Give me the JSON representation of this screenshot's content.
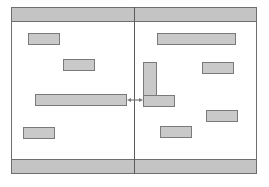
{
  "diagram": {
    "type": "wireframe-layout",
    "colors": {
      "frame_border": "#6e6e6e",
      "bar_fill": "#c4c4c4",
      "box_fill": "#c9c9c9",
      "box_border": "#7a7a7a",
      "divider": "#5a5a5a",
      "connector": "#7a7a7a",
      "background": "#ffffff"
    },
    "frame": {
      "x": 11,
      "y": 7,
      "w": 246,
      "h": 167
    },
    "divider": {
      "x": 134,
      "y": 7,
      "w": 1,
      "h": 167
    },
    "panels": [
      {
        "name": "left-panel",
        "header": {
          "x": 11,
          "y": 7,
          "w": 124,
          "h": 15
        },
        "footer": {
          "x": 11,
          "y": 159,
          "w": 124,
          "h": 15
        },
        "boxes": [
          {
            "id": "A",
            "x": 28,
            "y": 33,
            "w": 32,
            "h": 12
          },
          {
            "id": "B",
            "x": 63,
            "y": 59,
            "w": 32,
            "h": 12
          },
          {
            "id": "C",
            "x": 35,
            "y": 94,
            "w": 92,
            "h": 12
          },
          {
            "id": "D",
            "x": 23,
            "y": 127,
            "w": 32,
            "h": 12
          }
        ]
      },
      {
        "name": "right-panel",
        "header": {
          "x": 134,
          "y": 7,
          "w": 123,
          "h": 15
        },
        "footer": {
          "x": 134,
          "y": 159,
          "w": 123,
          "h": 15
        },
        "boxes": [
          {
            "id": "E",
            "x": 157,
            "y": 33,
            "w": 79,
            "h": 12
          },
          {
            "id": "F",
            "x": 202,
            "y": 62,
            "w": 32,
            "h": 12
          },
          {
            "id": "G",
            "x": 143,
            "y": 62,
            "w": 14,
            "h": 34
          },
          {
            "id": "H",
            "x": 143,
            "y": 95,
            "w": 32,
            "h": 12
          },
          {
            "id": "I",
            "x": 206,
            "y": 110,
            "w": 32,
            "h": 12
          },
          {
            "id": "J",
            "x": 160,
            "y": 126,
            "w": 32,
            "h": 12
          }
        ]
      }
    ],
    "connectors": [
      {
        "from": "C",
        "to": "H",
        "style": "double-arrow",
        "x1": 127,
        "y1": 100,
        "x2": 143,
        "y2": 100
      }
    ]
  }
}
